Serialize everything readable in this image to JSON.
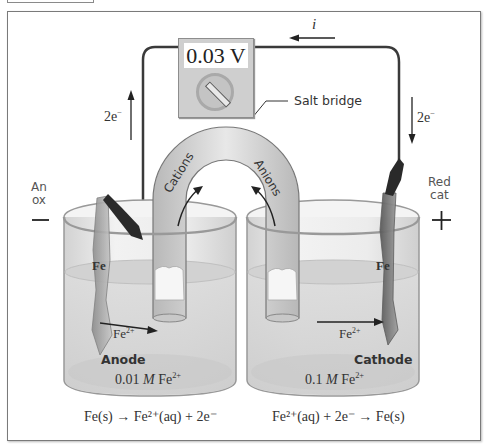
{
  "figure": {
    "voltmeter": {
      "reading": "0.03 V"
    },
    "current": {
      "label": "i",
      "direction": "left"
    },
    "left_wire": {
      "electron_label": "2e",
      "electron_sup": "−",
      "direction": "up"
    },
    "right_wire": {
      "electron_label": "2e",
      "electron_sup": "−",
      "direction": "down"
    },
    "salt_bridge": {
      "label": "Salt bridge",
      "cations_label": "Cations",
      "anions_label": "Anions"
    },
    "anode_side": {
      "terminal_label_line1": "An",
      "terminal_label_line2": "ox",
      "sign": "−",
      "electrode_label": "Fe",
      "ion_label": "Fe",
      "ion_sup": "2+",
      "electrode_name": "Anode",
      "concentration_value": "0.01",
      "concentration_unit": "M",
      "concentration_species": "Fe",
      "concentration_sup": "2+",
      "half_reaction": "Fe(s) → Fe²⁺(aq) + 2e⁻"
    },
    "cathode_side": {
      "terminal_label_line1": "Red",
      "terminal_label_line2": "cat",
      "sign": "+",
      "electrode_label": "Fe",
      "ion_label": "Fe",
      "ion_sup": "2+",
      "electrode_name": "Cathode",
      "concentration_value": "0.1",
      "concentration_unit": "M",
      "concentration_species": "Fe",
      "concentration_sup": "2+",
      "half_reaction": "Fe²⁺(aq) + 2e⁻ → Fe(s)"
    },
    "colors": {
      "wire": "#3a3a3a",
      "glass": "#e6e6e6",
      "solution": "#d6d6d6",
      "salt_bridge": "#cfcfcf",
      "electrode": "#a8a8a8",
      "clip": "#2a2a2a",
      "text": "#333333"
    }
  }
}
